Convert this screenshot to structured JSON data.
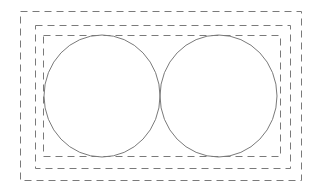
{
  "diagram": {
    "background": "#ffffff",
    "stroke_color": "#7a7a7a",
    "rectangles": [
      {
        "name": "outer",
        "x": 20,
        "y": 11,
        "width": 281,
        "height": 169,
        "dash": "7,5"
      },
      {
        "name": "middle",
        "x": 35,
        "y": 25,
        "width": 255,
        "height": 143,
        "dash": "7,5"
      },
      {
        "name": "inner",
        "x": 43,
        "y": 35,
        "width": 237,
        "height": 121,
        "dash": "7,5"
      }
    ],
    "circles": [
      {
        "name": "left",
        "cx": 102,
        "cy": 96,
        "rx": 58,
        "ry": 61
      },
      {
        "name": "right",
        "cx": 218.5,
        "cy": 96,
        "rx": 58.5,
        "ry": 61
      }
    ]
  }
}
